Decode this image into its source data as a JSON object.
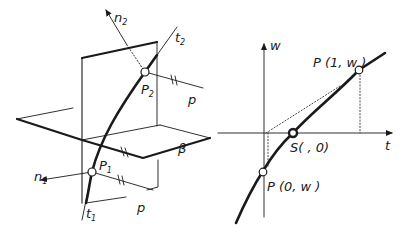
{
  "figure": {
    "left_panel": {
      "title": "Shooting method geometry (3D)",
      "labels": {
        "n2": "n",
        "n2_sub": "2",
        "t2": "t",
        "t2_sub": "2",
        "P2": "P",
        "P2_sub": "2",
        "p_upper": "p",
        "beta": "β",
        "n1": "n",
        "n1_sub": "1",
        "P1": "P",
        "P1_sub": "1",
        "p_lower": "p",
        "t1": "t",
        "t1_sub": "1"
      }
    },
    "right_panel": {
      "axes": {
        "y_label": "w",
        "x_label": "t"
      },
      "points": {
        "P_end": "P (1, w )",
        "S": "S( , 0)",
        "P_start": "P (0, w )"
      }
    },
    "colors": {
      "ink": "#1a1a1a",
      "background": "#ffffff"
    }
  }
}
